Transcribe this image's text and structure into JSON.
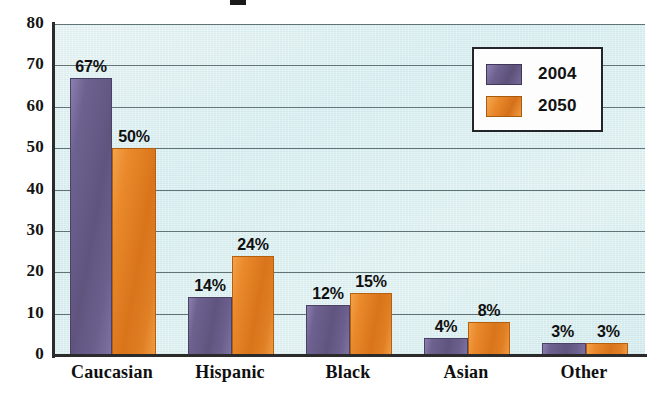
{
  "chart_data": {
    "type": "bar",
    "title": "",
    "xlabel": "",
    "ylabel": "",
    "ylim": [
      0,
      80
    ],
    "yticks": [
      "0",
      "10",
      "20",
      "30",
      "40",
      "50",
      "60",
      "70",
      "80"
    ],
    "grid": true,
    "legend_position": "top-right",
    "categories": [
      "Caucasian",
      "Hispanic",
      "Black",
      "Asian",
      "Other"
    ],
    "series": [
      {
        "name": "2004",
        "color": "#6D6190",
        "values": [
          67,
          14,
          12,
          4,
          3
        ],
        "labels": [
          "67%",
          "14%",
          "12%",
          "4%",
          "3%"
        ]
      },
      {
        "name": "2050",
        "color": "#E8862A",
        "values": [
          50,
          24,
          15,
          8,
          3
        ],
        "labels": [
          "50%",
          "24%",
          "15%",
          "8%",
          "3%"
        ]
      }
    ]
  },
  "legend": {
    "items": [
      {
        "label": "2004",
        "swatch": "purple-swatch"
      },
      {
        "label": "2050",
        "swatch": "orange-swatch"
      }
    ]
  },
  "colors": {
    "series_2004": "#6D6190",
    "series_2050": "#E8862A",
    "plot_background": "#DCF0F0",
    "canvas_background": "#FFFFFF",
    "axis": "#2B2B2B",
    "gridline": "#55696D",
    "text": "#101010"
  },
  "title_fragment": ""
}
